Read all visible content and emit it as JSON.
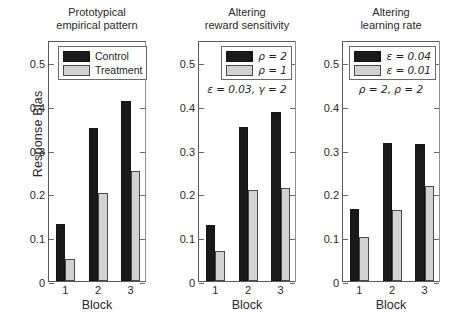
{
  "figure": {
    "ylabel": "Response Bias",
    "xlabel": "Block",
    "y_ticklabels": [
      "0",
      "0.1",
      "0.2",
      "0.3",
      "0.4",
      "0.5"
    ],
    "x_ticklabels": [
      "1",
      "2",
      "3"
    ]
  },
  "chart_data": [
    {
      "type": "bar",
      "title": "Prototypical empirical pattern",
      "title_line1": "Prototypical",
      "title_line2": "empirical pattern",
      "categories": [
        "1",
        "2",
        "3"
      ],
      "xlabel": "Block",
      "ylabel": "Response Bias",
      "ylim": [
        0,
        0.55
      ],
      "yticks": [
        0,
        0.1,
        0.2,
        0.3,
        0.4,
        0.5
      ],
      "grid": false,
      "legend_position": "top-center",
      "series": [
        {
          "name": "Control",
          "color": "#1a1a1a",
          "values": [
            0.13,
            0.35,
            0.41
          ]
        },
        {
          "name": "Treatment",
          "color": "#d2d2d2",
          "values": [
            0.05,
            0.2,
            0.25
          ]
        }
      ],
      "annotation": ""
    },
    {
      "type": "bar",
      "title": "Altering reward sensitivity",
      "title_line1": "Altering",
      "title_line2": "reward sensitivity",
      "categories": [
        "1",
        "2",
        "3"
      ],
      "xlabel": "Block",
      "ylabel": "Response Bias",
      "ylim": [
        0,
        0.55
      ],
      "yticks": [
        0,
        0.1,
        0.2,
        0.3,
        0.4,
        0.5
      ],
      "grid": false,
      "legend_position": "top-right",
      "series": [
        {
          "name": "ρ = 2",
          "color": "#1a1a1a",
          "values": [
            0.128,
            0.352,
            0.385
          ]
        },
        {
          "name": "ρ = 1",
          "color": "#d2d2d2",
          "values": [
            0.069,
            0.207,
            0.212
          ]
        }
      ],
      "annotation": "ε = 0.03, γ = 2"
    },
    {
      "type": "bar",
      "title": "Altering learning rate",
      "title_line1": "Altering",
      "title_line2": "learning rate",
      "categories": [
        "1",
        "2",
        "3"
      ],
      "xlabel": "Block",
      "ylabel": "Response Bias",
      "ylim": [
        0,
        0.55
      ],
      "yticks": [
        0,
        0.1,
        0.2,
        0.3,
        0.4,
        0.5
      ],
      "grid": false,
      "legend_position": "top-right",
      "series": [
        {
          "name": "ε = 0.04",
          "color": "#1a1a1a",
          "values": [
            0.165,
            0.315,
            0.313
          ]
        },
        {
          "name": "ε = 0.01",
          "color": "#d2d2d2",
          "values": [
            0.101,
            0.163,
            0.217
          ]
        }
      ],
      "annotation": "ρ = 2, ρ = 2"
    }
  ]
}
